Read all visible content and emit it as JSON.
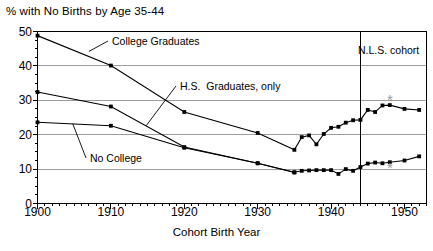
{
  "chart_data": {
    "type": "line",
    "title": "% with No Births by Age 35-44",
    "xlabel": "Cohort Birth Year",
    "ylabel": "",
    "xlim": [
      1900,
      1953
    ],
    "ylim": [
      0,
      50
    ],
    "xticks": [
      1900,
      1910,
      1920,
      1930,
      1940,
      1950
    ],
    "yticks": [
      0,
      10,
      20,
      30,
      40,
      50
    ],
    "grid": "horizontal",
    "legend_position": "inline-annotations",
    "annotations": [
      {
        "text": "College Graduates",
        "points_to_year": 1907,
        "points_to_value": 44.5
      },
      {
        "text": "H.S.  Graduates, only",
        "points_to_year": 1914.5,
        "points_to_value": 22.8
      },
      {
        "text": "No College",
        "points_to_year": 1904.5,
        "points_to_value": 23.3
      },
      {
        "text": "N.L.S. cohort",
        "vline_year": 1944
      }
    ],
    "series": [
      {
        "name": "College Graduates",
        "color": "#000000",
        "points": [
          [
            1900,
            48.8
          ],
          [
            1910,
            40.1
          ],
          [
            1920,
            26.6
          ],
          [
            1930,
            20.5
          ],
          [
            1935,
            15.6
          ],
          [
            1936,
            19.3
          ],
          [
            1937,
            19.8
          ],
          [
            1938,
            17.2
          ],
          [
            1939,
            20.2
          ],
          [
            1940,
            22.0
          ],
          [
            1941,
            22.3
          ],
          [
            1942,
            23.5
          ],
          [
            1943,
            24.2
          ],
          [
            1944,
            24.3
          ],
          [
            1945,
            27.2
          ],
          [
            1946,
            26.6
          ],
          [
            1947,
            28.5
          ],
          [
            1948,
            28.6
          ],
          [
            1950,
            27.5
          ],
          [
            1952,
            27.2
          ]
        ]
      },
      {
        "name": "H.S.  Graduates, only",
        "color": "#000000",
        "points": [
          [
            1900,
            32.4
          ],
          [
            1910,
            28.2
          ],
          [
            1920,
            16.4
          ],
          [
            1930,
            11.7
          ],
          [
            1935,
            9.0
          ]
        ]
      },
      {
        "name": "No College",
        "color": "#000000",
        "points": [
          [
            1900,
            23.6
          ],
          [
            1910,
            22.6
          ],
          [
            1920,
            16.2
          ],
          [
            1930,
            11.7
          ],
          [
            1935,
            9.1
          ],
          [
            1936,
            9.5
          ],
          [
            1937,
            9.6
          ],
          [
            1938,
            9.7
          ],
          [
            1939,
            9.7
          ],
          [
            1940,
            9.7
          ],
          [
            1941,
            8.6
          ],
          [
            1942,
            10.0
          ],
          [
            1943,
            9.5
          ],
          [
            1944,
            10.6
          ],
          [
            1945,
            11.6
          ],
          [
            1946,
            11.9
          ],
          [
            1947,
            11.7
          ],
          [
            1948,
            12.0
          ],
          [
            1950,
            12.5
          ],
          [
            1952,
            13.7
          ]
        ]
      }
    ],
    "special_markers": [
      {
        "symbol": "*",
        "year": 1948,
        "value": 30.0,
        "color": "#9a9a9a"
      },
      {
        "symbol": "*",
        "year": 1948,
        "value": 10.1,
        "color": "#9a9a9a"
      }
    ]
  }
}
